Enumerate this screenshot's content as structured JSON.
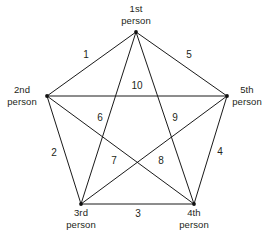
{
  "diagram": {
    "type": "complete-graph-k5",
    "title": "",
    "width": 270,
    "height": 241,
    "background_color": "#ffffff",
    "line_color": "#1a1a1a",
    "text_color": "#231f20",
    "vertices": [
      {
        "id": "v1",
        "label_line1": "1st",
        "label_line2": "person",
        "x": 136,
        "y": 32,
        "label_x": 136,
        "label_y": 3,
        "label_anchor": "center"
      },
      {
        "id": "v2",
        "label_line1": "2nd",
        "label_line2": "person",
        "x": 47,
        "y": 96,
        "label_x": 22,
        "label_y": 84,
        "label_anchor": "center"
      },
      {
        "id": "v5",
        "label_line1": "5th",
        "label_line2": "person",
        "x": 227,
        "y": 96,
        "label_x": 247,
        "label_y": 84,
        "label_anchor": "center"
      },
      {
        "id": "v3",
        "label_line1": "3rd",
        "label_line2": "person",
        "x": 81,
        "y": 204,
        "label_x": 81,
        "label_y": 207,
        "label_anchor": "center"
      },
      {
        "id": "v4",
        "label_line1": "4th",
        "label_line2": "person",
        "x": 194,
        "y": 204,
        "label_x": 194,
        "label_y": 207,
        "label_anchor": "center"
      }
    ],
    "edges": [
      {
        "number": "1",
        "from": "v1",
        "to": "v2",
        "label_x": 86,
        "label_y": 55,
        "kind": "side"
      },
      {
        "number": "5",
        "from": "v1",
        "to": "v5",
        "label_x": 189,
        "label_y": 55,
        "kind": "side"
      },
      {
        "number": "2",
        "from": "v2",
        "to": "v3",
        "label_x": 54,
        "label_y": 153,
        "kind": "side"
      },
      {
        "number": "4",
        "from": "v5",
        "to": "v4",
        "label_x": 220,
        "label_y": 152,
        "kind": "side"
      },
      {
        "number": "3",
        "from": "v3",
        "to": "v4",
        "label_x": 138,
        "label_y": 214,
        "kind": "side"
      },
      {
        "number": "10",
        "from": "v2",
        "to": "v5",
        "label_x": 137,
        "label_y": 86,
        "kind": "diagonal"
      },
      {
        "number": "6",
        "from": "v2",
        "to": "v4",
        "label_x": 100,
        "label_y": 118,
        "kind": "diagonal"
      },
      {
        "number": "9",
        "from": "v5",
        "to": "v3",
        "label_x": 175,
        "label_y": 118,
        "kind": "diagonal"
      },
      {
        "number": "7",
        "from": "v1",
        "to": "v3",
        "label_x": 114,
        "label_y": 161,
        "kind": "diagonal"
      },
      {
        "number": "8",
        "from": "v1",
        "to": "v4",
        "label_x": 161,
        "label_y": 161,
        "kind": "diagonal"
      }
    ]
  }
}
